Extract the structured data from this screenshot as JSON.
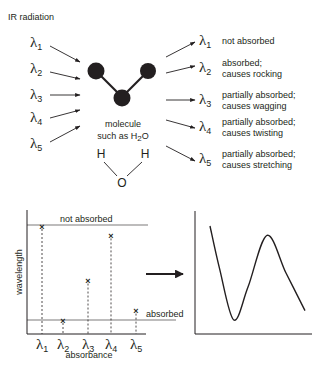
{
  "title": "IR radiation",
  "lambda_symbol": "λ",
  "incoming": [
    {
      "symbol": "λ",
      "index": "1"
    },
    {
      "symbol": "λ",
      "index": "2"
    },
    {
      "symbol": "λ",
      "index": "3"
    },
    {
      "symbol": "λ",
      "index": "4"
    },
    {
      "symbol": "λ",
      "index": "5"
    }
  ],
  "outgoing": [
    {
      "symbol": "λ",
      "index": "1",
      "line1": "not absorbed",
      "line2": ""
    },
    {
      "symbol": "λ",
      "index": "2",
      "line1": "absorbed;",
      "line2": "causes rocking"
    },
    {
      "symbol": "λ",
      "index": "3",
      "line1": "partially absorbed;",
      "line2": "causes wagging"
    },
    {
      "symbol": "λ",
      "index": "4",
      "line1": "partially absorbed;",
      "line2": "causes twisting"
    },
    {
      "symbol": "λ",
      "index": "5",
      "line1": "partially absorbed;",
      "line2": "causes stretching"
    }
  ],
  "molecule": {
    "caption_line1": "molecule",
    "caption_line2_prefix": "such as H",
    "caption_line2_sub": "2",
    "caption_line2_suffix": "O",
    "water": {
      "h_left": "H",
      "h_right": "H",
      "o": "O"
    }
  },
  "chart_data": [
    {
      "type": "scatter",
      "title": "",
      "xlabel": "absorbance",
      "ylabel": "wavelength",
      "categories": [
        "λ1",
        "λ2",
        "λ3",
        "λ4",
        "λ5"
      ],
      "values": [
        1.0,
        0.0,
        0.42,
        0.9,
        0.1
      ],
      "value_scale": "fraction between 'absorbed' (0) and 'not absorbed' (1) reference lines",
      "reference_lines": [
        {
          "label": "not absorbed",
          "value": 1.0
        },
        {
          "label": "absorbed",
          "value": 0.0
        }
      ],
      "marker": "×",
      "drop_lines": "dotted"
    },
    {
      "type": "line",
      "title": "",
      "xlabel": "",
      "ylabel": "",
      "x": [
        0,
        0.1,
        0.25,
        0.4,
        0.6,
        0.8,
        1.0
      ],
      "values": [
        1.0,
        0.55,
        0.0,
        0.35,
        0.9,
        0.5,
        0.1
      ],
      "description": "smooth continuous spectrum curve interpolated through the discrete points"
    }
  ]
}
